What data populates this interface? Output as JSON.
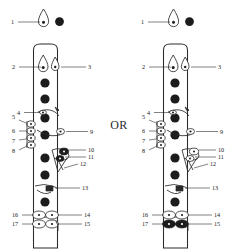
{
  "figure": {
    "separator_label": "OR",
    "variant_count": 2
  },
  "panels": [
    {
      "id": "left",
      "name": "flute-diagram-left",
      "description": "Flute with closed (filled) trill key cluster at callouts 10-11 and open foot keys",
      "key10_style": "filled",
      "key15_style": "open"
    },
    {
      "id": "right",
      "name": "flute-diagram-right",
      "description": "Flute with open trill key cluster at callouts 10-11 and filled foot key at 15",
      "key10_style": "open",
      "key15_style": "filled"
    }
  ],
  "callouts": [
    {
      "n": "1",
      "side": "left",
      "target": "headjoint-crown-key"
    },
    {
      "n": "2",
      "side": "left",
      "target": "thumb-key-b"
    },
    {
      "n": "3",
      "side": "right",
      "target": "thumb-key-bb"
    },
    {
      "n": "4",
      "side": "left",
      "target": "g-sharp-lever"
    },
    {
      "n": "5",
      "side": "left",
      "target": "trill-key-upper"
    },
    {
      "n": "6",
      "side": "left",
      "target": "trill-key-second"
    },
    {
      "n": "7",
      "side": "left",
      "target": "trill-key-third"
    },
    {
      "n": "8",
      "side": "left",
      "target": "trill-key-lower"
    },
    {
      "n": "9",
      "side": "right",
      "target": "g-sharp-key-cup"
    },
    {
      "n": "10",
      "side": "right",
      "target": "trill-lever-upper"
    },
    {
      "n": "11",
      "side": "right",
      "target": "trill-lever-lower"
    },
    {
      "n": "12",
      "side": "right",
      "target": "trill-linkage-rod"
    },
    {
      "n": "13",
      "side": "right",
      "target": "f-sharp-key-arm"
    },
    {
      "n": "14",
      "side": "right",
      "target": "foot-key-upper-right"
    },
    {
      "n": "15",
      "side": "right",
      "target": "foot-key-lower-right"
    },
    {
      "n": "16",
      "side": "left",
      "target": "foot-key-upper-left"
    },
    {
      "n": "17",
      "side": "left",
      "target": "foot-key-lower-left"
    }
  ],
  "colors": {
    "ink": "#1a1a1a",
    "stroke": "#2a2a2a",
    "fill_key": "#1c1c1c",
    "background": "#ffffff"
  }
}
